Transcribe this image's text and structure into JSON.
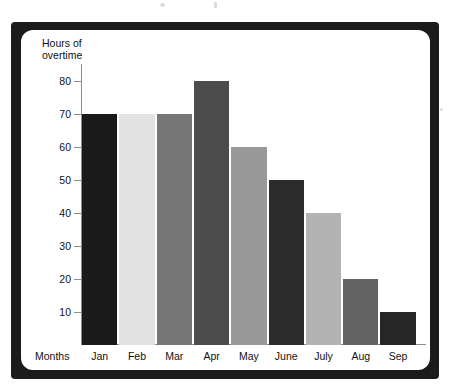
{
  "chart_data": {
    "type": "bar",
    "title": "",
    "subtitle": "",
    "xlabel": "Months",
    "ylabel": "Hours of\novertime",
    "categories": [
      "Jan",
      "Feb",
      "Mar",
      "Apr",
      "May",
      "June",
      "July",
      "Aug",
      "Sep"
    ],
    "values": [
      70,
      70,
      70,
      80,
      60,
      50,
      40,
      20,
      10
    ],
    "bar_colors": [
      "#1a1a1a",
      "#e2e2e2",
      "#777777",
      "#4c4c4c",
      "#999999",
      "#2b2b2b",
      "#b3b3b3",
      "#626262",
      "#262626"
    ],
    "ylim": [
      0,
      85
    ],
    "yticks": [
      10,
      20,
      30,
      40,
      50,
      60,
      70,
      80
    ],
    "ytick_labels": [
      "10",
      "20",
      "30",
      "40",
      "50",
      "60",
      "70",
      "80"
    ],
    "grid": false,
    "legend": null,
    "series": [
      {
        "name": "Hours of overtime",
        "values": [
          70,
          70,
          70,
          80,
          60,
          50,
          40,
          20,
          10
        ]
      }
    ],
    "annotations": []
  },
  "figure": {
    "axis_color": "#8d8d8d",
    "frame_color": "#1b1b1b",
    "background_color": "#ffffff",
    "text_color": "#111111"
  }
}
